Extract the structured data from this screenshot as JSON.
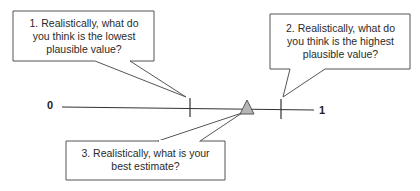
{
  "diagram": {
    "scale": {
      "min_label": "0",
      "max_label": "1"
    },
    "callouts": [
      {
        "id": "lowest",
        "text_lines": [
          "1. Realistically, what do",
          "you think is the lowest",
          "plausible value?"
        ]
      },
      {
        "id": "highest",
        "text_lines": [
          "2. Realistically, what do",
          "you think is the highest",
          "plausible value?"
        ]
      },
      {
        "id": "best",
        "text_lines": [
          "3. Realistically, what is your",
          "best estimate?"
        ]
      }
    ],
    "colors": {
      "line": "#333333",
      "bubble_border": "#555555",
      "marker_fill": "#b5b5b5"
    }
  }
}
